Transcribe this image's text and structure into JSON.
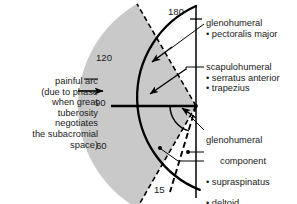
{
  "figure": {
    "type": "polar-range-of-motion-diagram",
    "pivot": {
      "x": 196,
      "y": 106
    },
    "radius_main": 100,
    "colors": {
      "shaded_wedge": "#c9c9c9",
      "stroke": "#000000",
      "text": "#1a1a1a",
      "background": "#ffffff"
    }
  },
  "axis": {
    "vertical_line_x": 196,
    "ticks": [
      {
        "label": "180",
        "angle_deg": 180,
        "x": 168,
        "y": 7
      },
      {
        "label": "120",
        "angle_deg": 120,
        "x": 96,
        "y": 53
      },
      {
        "label": "90",
        "angle_deg": 90,
        "x": 95,
        "y": 97
      },
      {
        "label": "60",
        "angle_deg": 60,
        "x": 96,
        "y": 140
      },
      {
        "label": "15",
        "angle_deg": 15,
        "x": 154,
        "y": 184
      }
    ]
  },
  "painful_arc": {
    "caption": "painful arc\n(due to phase\nwhen great\ntuberosity\nnegotiates\nthe subacromial\nspace)",
    "start_angle_deg": 60,
    "end_angle_deg": 120,
    "arrow_target": {
      "x": 104,
      "y": 91
    }
  },
  "annotations": [
    {
      "id": "glenohumeral",
      "title": "glenohumeral",
      "items": [
        "pectoralis major"
      ],
      "text": "glenohumeral\n• pectoralis major"
    },
    {
      "id": "scapulohumeral",
      "title": "scapulohumeral",
      "items": [
        "serratus anterior",
        "trapezius"
      ],
      "text": "scapulohumeral\n• serratus anterior\n• trapezius"
    },
    {
      "id": "glenohumeral-component",
      "title": "glenohumeral component",
      "items": [
        "supraspinatus",
        "deltoid"
      ],
      "line1": "glenohumeral",
      "line2": "component",
      "line3": "• supraspinatus",
      "line4": "• deltoid"
    }
  ],
  "markers": [
    {
      "id": "supraspinatus-dot",
      "x": 160,
      "y": 148
    },
    {
      "id": "deltoid-dot",
      "x": 188,
      "y": 152
    }
  ]
}
